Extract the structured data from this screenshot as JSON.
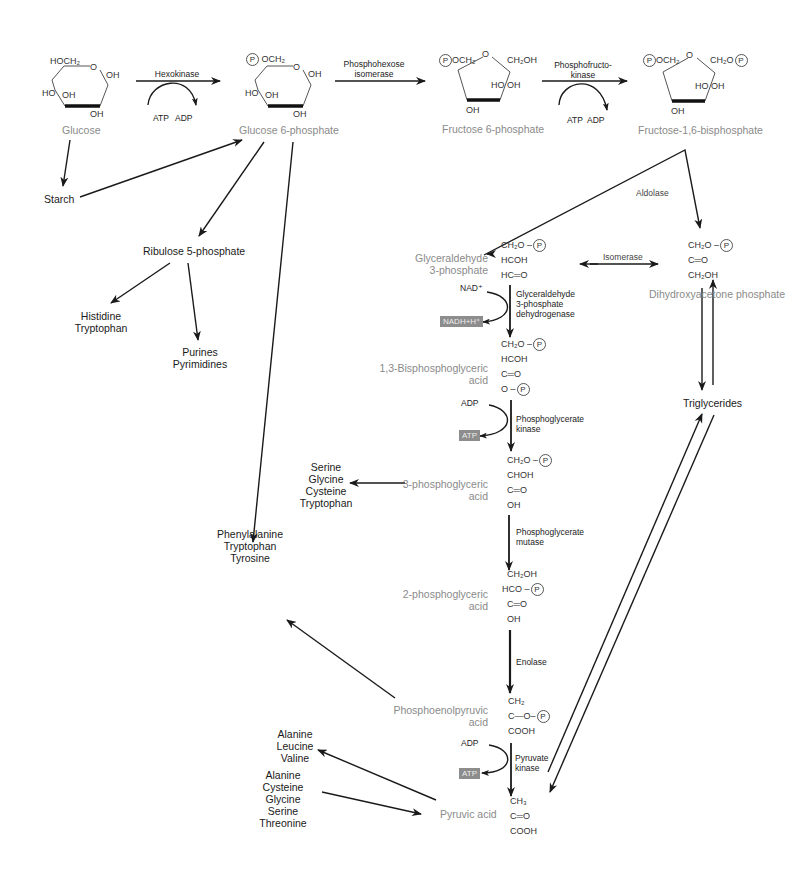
{
  "diagram": {
    "compounds": {
      "glucose": "Glucose",
      "glucose6p": "Glucose 6-phosphate",
      "fructose6p": "Fructose 6-phosphate",
      "fructose16bp": "Fructose-1,6-bisphosphate",
      "g3p": [
        "Glyceraldehyde",
        "3-phosphate"
      ],
      "dhap": "Dihydroxyacetone phosphate",
      "bpg13": [
        "1,3-Bisphosphoglyceric",
        "acid"
      ],
      "pg3": [
        "3-phosphoglyceric",
        "acid"
      ],
      "pg2": [
        "2-phosphoglyceric",
        "acid"
      ],
      "pep": [
        "Phosphoenolpyruvic",
        "acid"
      ],
      "pyruvate": "Pyruvic acid"
    },
    "branches": {
      "starch": "Starch",
      "ribulose5p": "Ribulose 5-phosphate",
      "his_trp": [
        "Histidine",
        "Tryptophan"
      ],
      "purines": [
        "Purines",
        "Pyrimidines"
      ],
      "aromatic": [
        "Phenylalanine",
        "Tryptophan",
        "Tyrosine"
      ],
      "serine_group": [
        "Serine",
        "Glycine",
        "Cysteine",
        "Tryptophan"
      ],
      "triglycerides": "Triglycerides",
      "ala_leu_val": [
        "Alanine",
        "Leucine",
        "Valine"
      ],
      "to_pyruvate": [
        "Alanine",
        "Cysteine",
        "Glycine",
        "Serine",
        "Threonine"
      ]
    },
    "enzymes": {
      "hexokinase": "Hexokinase",
      "phi": [
        "Phosphohexose",
        "isomerase"
      ],
      "pfk": [
        "Phosphofructo-",
        "kinase"
      ],
      "aldolase": "Aldolase",
      "isomerase": "Isomerase",
      "g3pdh": [
        "Glyceraldehyde",
        "3-phosphate",
        "dehydrogenase"
      ],
      "pgk": [
        "Phosphoglycerate",
        "kinase"
      ],
      "pgm": [
        "Phosphoglycerate",
        "mutase"
      ],
      "enolase": "Enolase",
      "pk": [
        "Pyruvate",
        "kinase"
      ]
    },
    "cofactors": {
      "hex_atp": "ATP",
      "hex_adp": "ADP",
      "pfk_atp": "ATP",
      "pfk_adp": "ADP",
      "nad": "NAD⁺",
      "nadh": "NADH+H⁺",
      "pgk_adp": "ADP",
      "pgk_atp": "ATP",
      "pk_adp": "ADP",
      "pk_atp": "ATP"
    },
    "rings": {
      "glucose": {
        "top": "HOCH₂",
        "o": "O",
        "oh_r": "OH",
        "ho_l": "HO",
        "oh_m": "OH",
        "oh_b": "OH"
      },
      "g6p": {
        "top": "OCH₂",
        "p": "P",
        "o": "O",
        "oh_r": "OH",
        "ho_l": "HO",
        "oh_m": "OH",
        "oh_b": "OH"
      },
      "f6p": {
        "left": "OCH₂",
        "p": "P",
        "o": "O",
        "right": "CH₂OH",
        "ho": "HO",
        "oh": "OH",
        "oh_b": "OH"
      },
      "f16bp": {
        "left": "OCH₂",
        "p": "P",
        "o": "O",
        "right": "CH₂O",
        "p2": "P",
        "ho": "HO",
        "oh": "OH",
        "oh_b": "OH"
      }
    },
    "structures": {
      "g3p": [
        "CH₂O –",
        "HCOH",
        "HC═O"
      ],
      "dhap": [
        "CH₂O –",
        "C═O",
        "CH₂OH"
      ],
      "bpg13": [
        "CH₂O –",
        "HCOH",
        "C═O",
        "O –"
      ],
      "pg3": [
        "CH₂O –",
        "CHOH",
        "C═O",
        "OH"
      ],
      "pg2": [
        "CH₂OH",
        "HCO –",
        "C═O",
        "OH"
      ],
      "pep": [
        "CH₂",
        "C—O–",
        "COOH"
      ],
      "pyruvate": [
        "CH₃",
        "C═O",
        "COOH"
      ],
      "p": "P"
    }
  }
}
